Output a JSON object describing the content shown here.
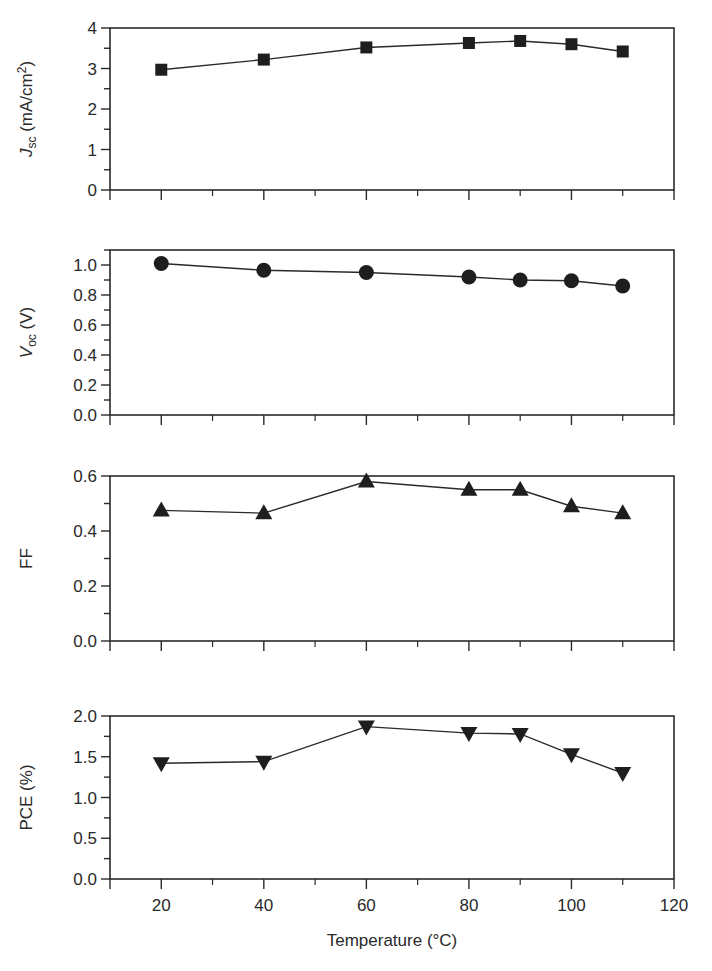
{
  "chart_data": [
    {
      "type": "line",
      "panel": "Jsc",
      "ylabel": "J_sc (mA/cm^2)",
      "ylabel_parts": {
        "main": "J",
        "sub": "sc",
        "rest": " (mA/cm",
        "sup": "2",
        "end": ")"
      },
      "xlabel": "",
      "x": [
        20,
        40,
        60,
        80,
        90,
        100,
        110
      ],
      "values": [
        2.97,
        3.22,
        3.52,
        3.63,
        3.68,
        3.6,
        3.42
      ],
      "marker": "square",
      "ylim": [
        0,
        4
      ],
      "yticks": [
        0,
        1,
        2,
        3,
        4
      ],
      "ytick_labels": [
        "0",
        "1",
        "2",
        "3",
        "4"
      ],
      "yminor_step": 0.5
    },
    {
      "type": "line",
      "panel": "Voc",
      "ylabel": "V_oc (V)",
      "ylabel_parts": {
        "main": "V",
        "sub": "oc",
        "rest": " (V)",
        "sup": "",
        "end": ""
      },
      "xlabel": "",
      "x": [
        20,
        40,
        60,
        80,
        90,
        100,
        110
      ],
      "values": [
        1.01,
        0.965,
        0.95,
        0.92,
        0.9,
        0.895,
        0.86
      ],
      "marker": "circle",
      "ylim": [
        0,
        1.1
      ],
      "yticks": [
        0.0,
        0.2,
        0.4,
        0.6,
        0.8,
        1.0
      ],
      "ytick_labels": [
        "0.0",
        "0.2",
        "0.4",
        "0.6",
        "0.8",
        "1.0"
      ],
      "yminor_step": 0.1
    },
    {
      "type": "line",
      "panel": "FF",
      "ylabel": "FF",
      "ylabel_parts": {
        "main": "FF",
        "sub": "",
        "rest": "",
        "sup": "",
        "end": ""
      },
      "xlabel": "",
      "x": [
        20,
        40,
        60,
        80,
        90,
        100,
        110
      ],
      "values": [
        0.475,
        0.465,
        0.58,
        0.55,
        0.55,
        0.49,
        0.465
      ],
      "marker": "triangle-up",
      "ylim": [
        0,
        0.6
      ],
      "yticks": [
        0.0,
        0.2,
        0.4,
        0.6
      ],
      "ytick_labels": [
        "0.0",
        "0.2",
        "0.4",
        "0.6"
      ],
      "yminor_step": 0.1
    },
    {
      "type": "line",
      "panel": "PCE",
      "ylabel": "PCE (%)",
      "ylabel_parts": {
        "main": "PCE (%)",
        "sub": "",
        "rest": "",
        "sup": "",
        "end": ""
      },
      "xlabel": "Temperature (°C)",
      "x": [
        20,
        40,
        60,
        80,
        90,
        100,
        110
      ],
      "values": [
        1.42,
        1.44,
        1.87,
        1.79,
        1.78,
        1.53,
        1.3
      ],
      "marker": "triangle-down",
      "ylim": [
        0,
        2.0
      ],
      "yticks": [
        0.0,
        0.5,
        1.0,
        1.5,
        2.0
      ],
      "ytick_labels": [
        "0.0",
        "0.5",
        "1.0",
        "1.5",
        "2.0"
      ],
      "yminor_step": 0.25
    }
  ],
  "x_axis": {
    "range": [
      10,
      120
    ],
    "major_ticks": [
      20,
      40,
      60,
      80,
      100,
      120
    ],
    "tick_labels": [
      "20",
      "40",
      "60",
      "80",
      "100",
      "120"
    ],
    "minor_ticks": [
      30,
      50,
      70,
      90,
      110
    ],
    "label": "Temperature (°C)"
  },
  "grid": false,
  "legend": null,
  "colors": {
    "ink": "#2a2a2a",
    "marker": "#1e1e1e",
    "background": "#ffffff"
  }
}
